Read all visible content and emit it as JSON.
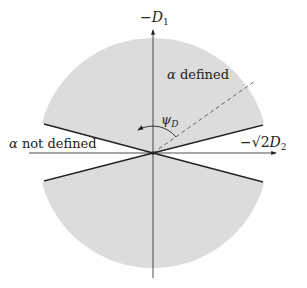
{
  "diagram": {
    "axes": {
      "vertical_label_prefix": "−",
      "vertical_label_var": "D",
      "vertical_label_sub": "1",
      "horizontal_label_prefix": "−√2",
      "horizontal_label_var": "D",
      "horizontal_label_sub": "2"
    },
    "regions": {
      "defined_alpha": "α",
      "defined_text": " defined",
      "not_defined_alpha": "α",
      "not_defined_text": " not defined"
    },
    "angle": {
      "symbol": "ψ",
      "sub": "D"
    },
    "colors": {
      "shaded": "#dcdcdc",
      "lines": "#222222",
      "background": "#ffffff"
    },
    "geometry": {
      "center": [
        153,
        153
      ],
      "radius": 115,
      "wedge_half_angle_deg": 15,
      "dashed_direction_deg": 33
    }
  }
}
